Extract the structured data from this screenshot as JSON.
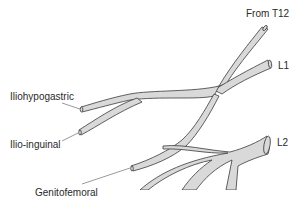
{
  "diagram": {
    "title": "",
    "labels": {
      "t12": "From T12",
      "l1": "L1",
      "l2": "L2",
      "iliohypogastric": "Iliohypogastric",
      "ilioinguinal": "Ilio-inguinal",
      "genitofemoral": "Genitofemoral"
    },
    "colors": {
      "nerve_fill": "#d9d9d9",
      "nerve_stroke": "#3a3a3a",
      "leader_line": "#555555",
      "text": "#2a2a2a",
      "background": "#ffffff"
    }
  }
}
